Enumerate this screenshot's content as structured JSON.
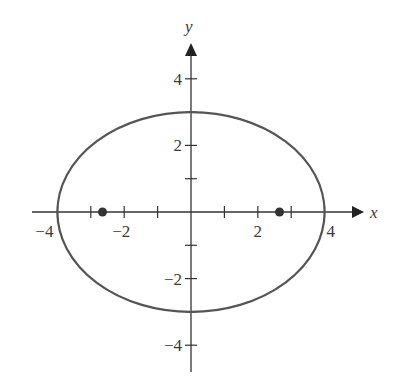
{
  "chart_data": {
    "type": "line",
    "title": "",
    "xlabel": "x",
    "ylabel": "y",
    "xlim": [
      -5,
      5
    ],
    "ylim": [
      -5,
      5
    ],
    "grid": false,
    "x_ticks": [
      -4,
      -3,
      -2,
      -1,
      1,
      2,
      3,
      4
    ],
    "y_ticks": [
      -4,
      -3,
      -2,
      -1,
      1,
      2,
      3,
      4
    ],
    "x_tick_labels": [
      {
        "value": -4,
        "label": "−4"
      },
      {
        "value": -2,
        "label": "−2"
      },
      {
        "value": 2,
        "label": "2"
      },
      {
        "value": 4,
        "label": "4"
      }
    ],
    "y_tick_labels": [
      {
        "value": 4,
        "label": "4"
      },
      {
        "value": 2,
        "label": "2"
      },
      {
        "value": -2,
        "label": "−2"
      },
      {
        "value": -4,
        "label": "−4"
      }
    ],
    "series": [
      {
        "name": "ellipse",
        "kind": "ellipse",
        "center": [
          0,
          0
        ],
        "semi_major_x": 4,
        "semi_minor_y": 3,
        "equation": "x^2/16 + y^2/9 = 1",
        "color": "#555555"
      },
      {
        "name": "foci",
        "kind": "points",
        "points": [
          [
            -2.65,
            0
          ],
          [
            2.65,
            0
          ]
        ],
        "color": "#333333"
      }
    ]
  },
  "labels": {
    "x_axis": "x",
    "y_axis": "y"
  }
}
